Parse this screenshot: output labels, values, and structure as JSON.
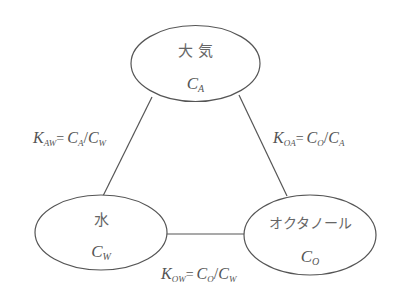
{
  "diagram": {
    "type": "partition-triangle",
    "colors": {
      "line": "#555555",
      "text": "#666666",
      "background": "#ffffff"
    },
    "nodes": [
      {
        "id": "air",
        "label": "大 気",
        "symbol": "C",
        "subscript": "A"
      },
      {
        "id": "water",
        "label": "水",
        "symbol": "C",
        "subscript": "W"
      },
      {
        "id": "octanol",
        "label": "オクタノール",
        "symbol": "C",
        "subscript": "O"
      }
    ],
    "edges": [
      {
        "from": "air",
        "to": "water",
        "k": "K",
        "k_sub": "AW",
        "eq": "=",
        "num": "C",
        "num_sub": "A",
        "slash": "/",
        "den": "C",
        "den_sub": "W"
      },
      {
        "from": "octanol",
        "to": "air",
        "k": "K",
        "k_sub": "OA",
        "eq": "=",
        "num": "C",
        "num_sub": "O",
        "slash": "/",
        "den": "C",
        "den_sub": "A"
      },
      {
        "from": "octanol",
        "to": "water",
        "k": "K",
        "k_sub": "OW",
        "eq": "=",
        "num": "C",
        "num_sub": "O",
        "slash": "/",
        "den": "C",
        "den_sub": "W"
      }
    ]
  }
}
